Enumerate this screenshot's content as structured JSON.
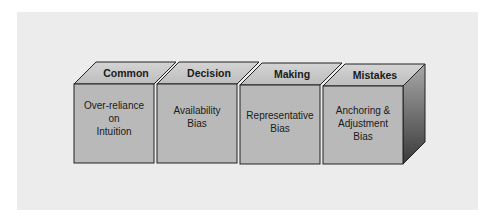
{
  "diagram": {
    "title_words": [
      "Common",
      "Decision",
      "Making",
      "Mistakes"
    ],
    "cubes": [
      {
        "top": "Common",
        "front": "Over-reliance\non\nIntuition"
      },
      {
        "top": "Decision",
        "front": "Availability\nBias"
      },
      {
        "top": "Making",
        "front": "Representative\nBias"
      },
      {
        "top": "Mistakes",
        "front": "Anchoring &\nAdjustment\nBias"
      }
    ],
    "colors": {
      "panel": "#ececec",
      "front": "#b9b9b9",
      "top": "#c9c9c9",
      "side_light": "#9a9a9a",
      "side_dark": "#3a3a3a",
      "outline": "#222222"
    }
  }
}
